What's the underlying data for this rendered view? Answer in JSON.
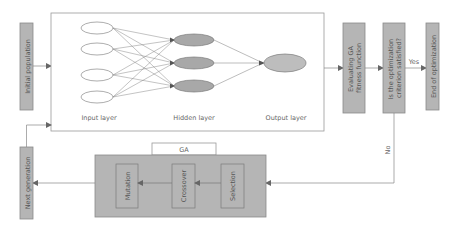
{
  "colors": {
    "box_fill": "#b5b5b5",
    "box_stroke": "#8a8a8a",
    "text": "#555555",
    "line": "#888888",
    "hidden_node_fill": "#a8a8a8",
    "output_node_fill": "#bdbdbd",
    "input_node_fill": "#ffffff"
  },
  "boxes": {
    "initial_population": "Initial population",
    "evaluating": [
      "Evaluating GA",
      "fitness function"
    ],
    "criterion": [
      "Is the optimization",
      "criterion satisfied?"
    ],
    "end": "End of optimization",
    "next_generation": "Next generation"
  },
  "neural_network": {
    "input_layer_label": "Input layer",
    "hidden_layer_label": "Hidden layer",
    "output_layer_label": "Output layer",
    "input_nodes": 4,
    "hidden_nodes": 3,
    "output_nodes": 1
  },
  "ga": {
    "title": "GA",
    "steps": [
      "Selection",
      "Crossover",
      "Mutation"
    ]
  },
  "edge_labels": {
    "yes": "Yes",
    "no": "No"
  }
}
